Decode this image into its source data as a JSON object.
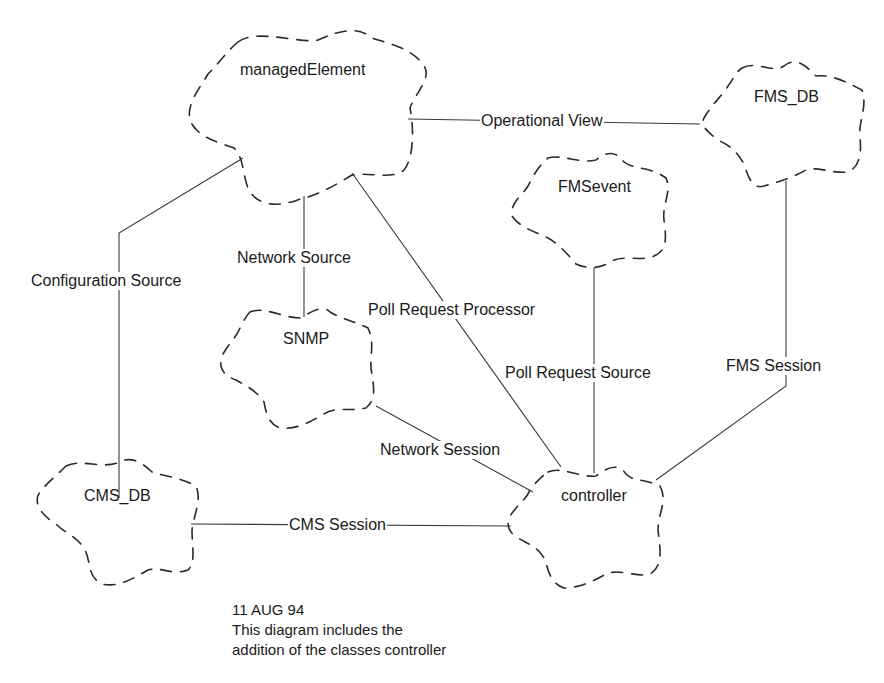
{
  "diagram": {
    "type": "class-diagram-booch-clouds",
    "classes": [
      {
        "id": "managedElement",
        "label": "managedElement"
      },
      {
        "id": "FMS_DB",
        "label": "FMS_DB"
      },
      {
        "id": "FMSevent",
        "label": "FMSevent"
      },
      {
        "id": "SNMP",
        "label": "SNMP"
      },
      {
        "id": "CMS_DB",
        "label": "CMS_DB"
      },
      {
        "id": "controller",
        "label": "controller"
      }
    ],
    "relationships": [
      {
        "from": "managedElement",
        "to": "FMS_DB",
        "label": "Operational View"
      },
      {
        "from": "managedElement",
        "to": "CMS_DB",
        "label": "Configuration Source"
      },
      {
        "from": "managedElement",
        "to": "SNMP",
        "label": "Network Source"
      },
      {
        "from": "managedElement",
        "to": "controller",
        "label": "Poll Request Processor"
      },
      {
        "from": "FMSevent",
        "to": "controller",
        "label": "Poll Request Source"
      },
      {
        "from": "FMS_DB",
        "to": "controller",
        "label": "FMS Session"
      },
      {
        "from": "SNMP",
        "to": "controller",
        "label": "Network Session"
      },
      {
        "from": "CMS_DB",
        "to": "controller",
        "label": "CMS Session"
      }
    ],
    "note": {
      "date": "11 AUG 94",
      "line1": "This diagram includes the",
      "line2": "addition of the classes controller"
    }
  }
}
